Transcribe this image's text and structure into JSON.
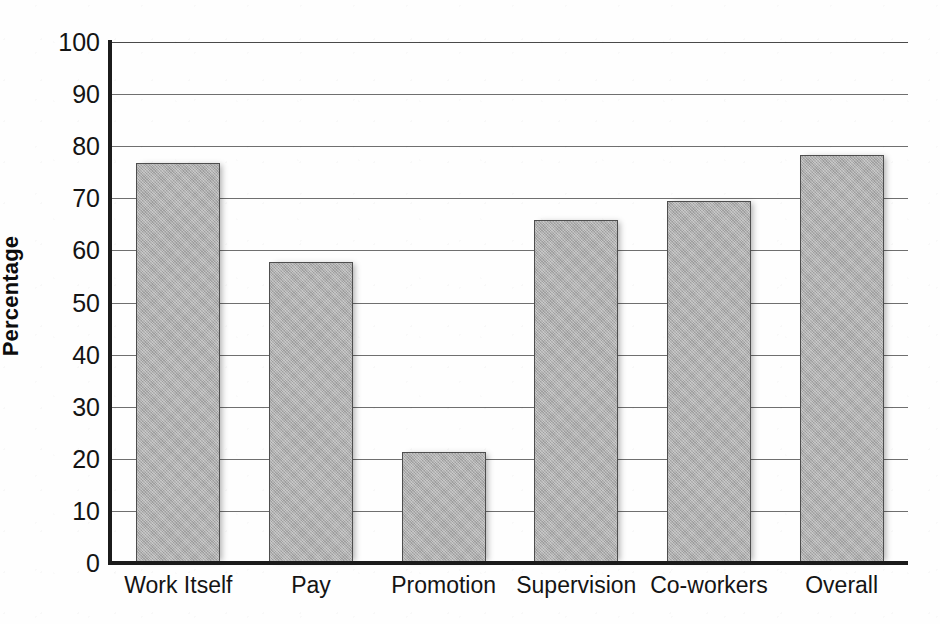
{
  "figure": {
    "background_color": "#ffffff",
    "bar_fill_color": "#adadad",
    "bar_border_color": "#4e4e4e",
    "axis_color": "#1b1b1b",
    "gridline_color": "#6f6f6f",
    "title_remnant": "Job Satisfaction"
  },
  "chart_data": {
    "type": "bar",
    "title": "",
    "xlabel": "",
    "ylabel": "Percentage",
    "categories": [
      "Work Itself",
      "Pay",
      "Promotion",
      "Supervision",
      "Co-workers",
      "Overall"
    ],
    "values": [
      76.8,
      57.8,
      21.3,
      65.8,
      69.5,
      78.3
    ],
    "ylim": [
      0,
      100
    ],
    "yticks": [
      0,
      10,
      20,
      30,
      40,
      50,
      60,
      70,
      80,
      90,
      100
    ],
    "ytick_labels": [
      "0",
      "10",
      "20",
      "30",
      "40",
      "50",
      "60",
      "70",
      "80",
      "90",
      "100"
    ],
    "grid": true,
    "grid_axis": "y",
    "legend": false,
    "legend_position": "none",
    "series": [
      {
        "name": "Percentage",
        "values": [
          76.8,
          57.8,
          21.3,
          65.8,
          69.5,
          78.3
        ]
      }
    ]
  }
}
